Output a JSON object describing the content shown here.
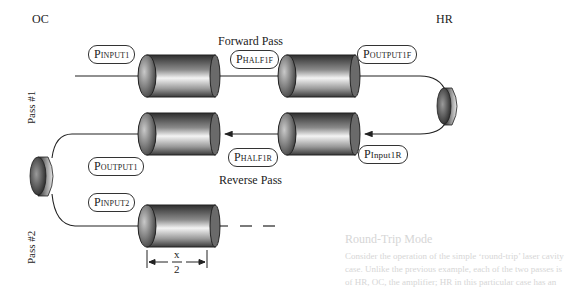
{
  "diagram": {
    "type": "laser amplifier double-pass schematic",
    "endpoints": {
      "left": "OC",
      "right": "HR"
    },
    "pass_labels": [
      "Pass #1",
      "Pass #2"
    ],
    "direction_labels": {
      "forward": "Forward Pass",
      "reverse": "Reverse Pass"
    },
    "power_labels": {
      "input1": {
        "main": "P",
        "sub": "INPUT1"
      },
      "half1f": {
        "main": "P",
        "sub": "HALF1F"
      },
      "output1f": {
        "main": "P",
        "sub": "OUTPUT1F"
      },
      "input1r": {
        "main": "P",
        "sub": "Input1R"
      },
      "half1r": {
        "main": "P",
        "sub": "HALF1R"
      },
      "output1": {
        "main": "P",
        "sub": "OUTPUT1"
      },
      "input2": {
        "main": "P",
        "sub": "INPUT2"
      }
    },
    "dimension": {
      "numerator": "x",
      "denominator": "2"
    },
    "continuation": "— — —",
    "colors": {
      "stroke": "#222222",
      "cylinder_dark": "#3a3a3a",
      "cylinder_light": "#f2f2f2",
      "background": "#ffffff"
    }
  },
  "background_bleed_text": {
    "heading": "Round-Trip Mode",
    "lines": [
      "Consider the operation of the simple ‘round-trip’ laser cavity",
      "case. Unlike the previous example, each of the two passes is",
      "of HR, OC, the amplifier; HR in this particular case has an"
    ]
  }
}
